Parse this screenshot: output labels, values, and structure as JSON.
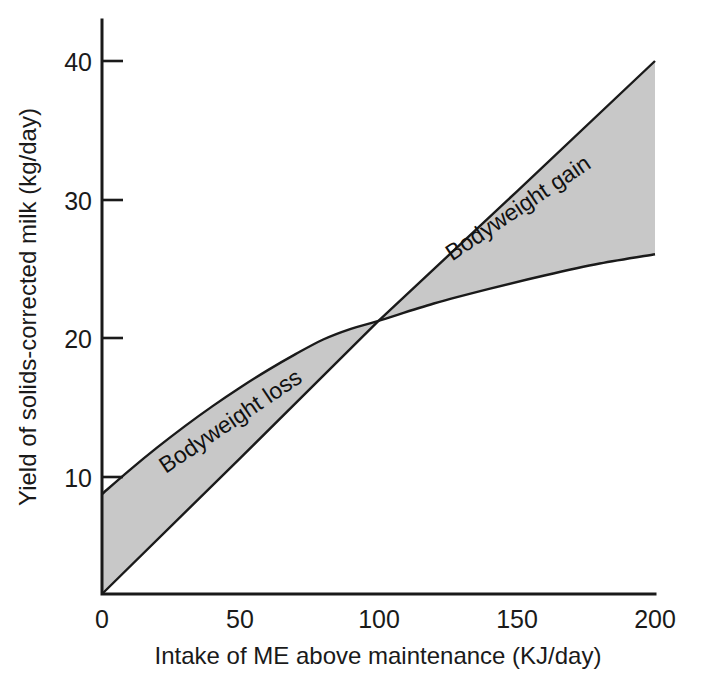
{
  "chart_data": {
    "type": "area",
    "title": "",
    "xlabel": "Intake of ME above maintenance (KJ/day)",
    "ylabel": "Yield of solids-corrected milk (kg/day)",
    "xlim": [
      0,
      200
    ],
    "ylim": [
      0,
      44
    ],
    "xticks": [
      0,
      50,
      100,
      150,
      200
    ],
    "xtick_labels": [
      "0",
      "50",
      "100",
      "150",
      "200"
    ],
    "yticks": [
      10,
      20,
      30,
      40
    ],
    "ytick_labels": [
      "10",
      "20",
      "30",
      "40"
    ],
    "grid": false,
    "legend": "none",
    "band_fill_color": "#c8c8c8",
    "line_color": "#1a1a1a",
    "series": [
      {
        "name": "diminishing-returns curve",
        "description": "Concave curve: upper boundary left of crossover, lower boundary right of crossover",
        "x": [
          0,
          10,
          20,
          30,
          40,
          50,
          60,
          70,
          80,
          90,
          100,
          120,
          140,
          160,
          180,
          200
        ],
        "values": [
          7.5,
          9.3,
          11.0,
          12.6,
          14.1,
          15.5,
          16.8,
          18.0,
          19.1,
          19.9,
          20.5,
          21.8,
          22.9,
          23.9,
          24.8,
          25.5
        ]
      },
      {
        "name": "linear response line",
        "description": "Straight line from origin: lower boundary left of crossover, upper boundary right of crossover",
        "x": [
          0,
          50,
          100,
          150,
          200
        ],
        "values": [
          0,
          10.2,
          20.5,
          30.2,
          40.0
        ]
      }
    ],
    "crossover_point": {
      "x": 100,
      "y": 20.5
    },
    "annotations": [
      {
        "text": "Bodyweight loss",
        "x": 48,
        "y": 12.5,
        "rotation_deg": -34
      },
      {
        "text": "Bodyweight gain",
        "x": 152,
        "y": 28.5,
        "rotation_deg": -34
      }
    ]
  },
  "axes": {
    "y_title": "Yield of solids-corrected milk (kg/day)",
    "x_title": "Intake of ME above maintenance (KJ/day)",
    "y_tick_labels": [
      "40",
      "30",
      "20",
      "10"
    ],
    "x_tick_labels": [
      "0",
      "50",
      "100",
      "150",
      "200"
    ]
  },
  "annotations": {
    "left_band": "Bodyweight loss",
    "right_band": "Bodyweight gain"
  }
}
